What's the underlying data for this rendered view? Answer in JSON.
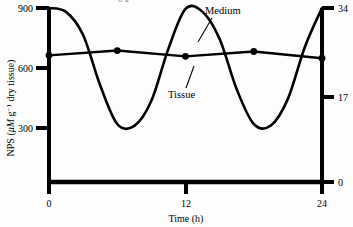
{
  "figure": {
    "background_color": "#fdfdfd",
    "ink_color": "#000000",
    "cropped_caption_fragment": "p    g"
  },
  "axes": {
    "left": {
      "title_main": "NPS (",
      "title_units_italic": "μM",
      "title_g": " g",
      "title_sup": "−1",
      "title_tail": " dry tissue)",
      "title_full": "NPS (μM g−1 dry tissue)",
      "ticks": [
        "900",
        "600",
        "300"
      ]
    },
    "right": {
      "ticks": [
        "34",
        "17",
        "0"
      ]
    },
    "bottom": {
      "title": "Time (h)",
      "ticks": [
        "0",
        "12",
        "24"
      ]
    }
  },
  "annotations": {
    "medium_label": "Medium",
    "tissue_label": "Tissue"
  },
  "chart_data": {
    "type": "line",
    "title": "",
    "xlabel": "Time (h)",
    "ylabel": "NPS (μM g−1 dry tissue)",
    "ylabel_right": "",
    "xlim": [
      0,
      24
    ],
    "ylim": [
      0,
      900
    ],
    "ylim_right": [
      0,
      34
    ],
    "xticks": [
      0,
      12,
      24
    ],
    "yticks": [
      300,
      600,
      900
    ],
    "yticks_right": [
      0,
      17,
      34
    ],
    "grid": false,
    "legend": "inline-annotations",
    "series": [
      {
        "name": "Medium",
        "style": "smooth-sinusoid-no-markers",
        "axis": "left",
        "x": [
          0,
          1.5,
          3,
          4.5,
          6,
          7.5,
          9,
          10.5,
          12,
          13.5,
          15,
          16.5,
          18,
          19.5,
          21,
          22.5,
          24
        ],
        "values": [
          900,
          880,
          760,
          500,
          300,
          290,
          420,
          690,
          895,
          880,
          740,
          480,
          300,
          292,
          430,
          700,
          900
        ]
      },
      {
        "name": "Tissue",
        "style": "near-flat-with-filled-circle-markers",
        "axis": "left",
        "x": [
          0,
          6,
          12,
          18,
          24
        ],
        "values": [
          655,
          680,
          650,
          675,
          640
        ]
      }
    ]
  }
}
